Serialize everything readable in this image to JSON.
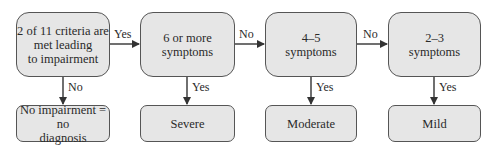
{
  "flow": {
    "decisions": [
      {
        "id": "criteria",
        "label": "2 of 11 criteria are met leading to impairment",
        "lines": [
          "2 of 11 criteria are",
          "met leading",
          "to impairment"
        ]
      },
      {
        "id": "six-plus",
        "label": "6 or more symptoms",
        "lines": [
          "6 or more",
          "symptoms"
        ]
      },
      {
        "id": "four-five",
        "label": "4–5 symptoms",
        "lines": [
          "4–5",
          "symptoms"
        ]
      },
      {
        "id": "two-three",
        "label": "2–3 symptoms",
        "lines": [
          "2–3",
          "symptoms"
        ]
      }
    ],
    "outcomes": [
      {
        "id": "no-diagnosis",
        "lines": [
          "No impairment = no",
          "diagnosis"
        ]
      },
      {
        "id": "severe",
        "lines": [
          "Severe"
        ]
      },
      {
        "id": "moderate",
        "lines": [
          "Moderate"
        ]
      },
      {
        "id": "mild",
        "lines": [
          "Mild"
        ]
      }
    ],
    "edges": {
      "criteria_to_six": "Yes",
      "six_to_four": "No",
      "four_to_two": "No",
      "criteria_down": "No",
      "six_down": "Yes",
      "four_down": "Yes",
      "two_down": "Yes"
    },
    "colors": {
      "box_fill": "#e6e6e6",
      "box_border": "#555555",
      "arrow": "#333333"
    }
  }
}
